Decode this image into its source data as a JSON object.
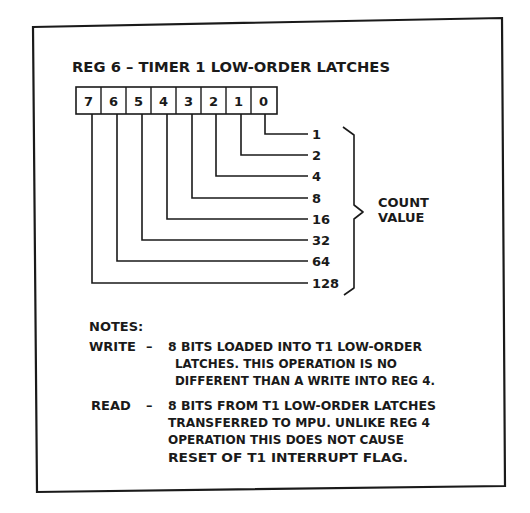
{
  "title": "REG 6 – TIMER 1 LOW-ORDER LATCHES",
  "register": {
    "bits": [
      "7",
      "6",
      "5",
      "4",
      "3",
      "2",
      "1",
      "0"
    ],
    "weights": [
      {
        "bit": "0",
        "value": "1"
      },
      {
        "bit": "1",
        "value": "2"
      },
      {
        "bit": "2",
        "value": "4"
      },
      {
        "bit": "3",
        "value": "8"
      },
      {
        "bit": "4",
        "value": "16"
      },
      {
        "bit": "5",
        "value": "32"
      },
      {
        "bit": "6",
        "value": "64"
      },
      {
        "bit": "7",
        "value": "128"
      }
    ],
    "brace_label_line1": "COUNT",
    "brace_label_line2": "VALUE"
  },
  "notes": {
    "heading": "NOTES:",
    "write": {
      "label": "WRITE",
      "dash": "–",
      "lines": [
        "8 BITS LOADED INTO T1 LOW-ORDER",
        "LATCHES. THIS OPERATION IS NO",
        "DIFFERENT THAN A WRITE INTO REG 4."
      ]
    },
    "read": {
      "label": "READ",
      "dash": "–",
      "lines": [
        "8 BITS FROM T1 LOW-ORDER LATCHES",
        "TRANSFERRED TO MPU. UNLIKE REG 4",
        "OPERATION THIS DOES NOT CAUSE",
        "RESET OF T1 INTERRUPT FLAG."
      ]
    }
  }
}
